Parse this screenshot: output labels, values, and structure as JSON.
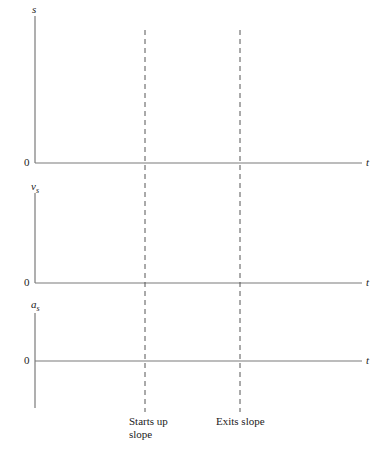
{
  "diagram": {
    "graphs": [
      {
        "y_label": "s",
        "y_label_sub": "",
        "zero_label": "0",
        "x_label": "t"
      },
      {
        "y_label": "v",
        "y_label_sub": "s",
        "zero_label": "0",
        "x_label": "t"
      },
      {
        "y_label": "a",
        "y_label_sub": "s",
        "zero_label": "0",
        "x_label": "t"
      }
    ],
    "markers": [
      {
        "label_line1": "Starts up",
        "label_line2": "slope"
      },
      {
        "label_line1": "Exits slope",
        "label_line2": ""
      }
    ],
    "colors": {
      "axis": "#7a7a7a",
      "dashed": "#555555",
      "text": "#222222"
    }
  }
}
